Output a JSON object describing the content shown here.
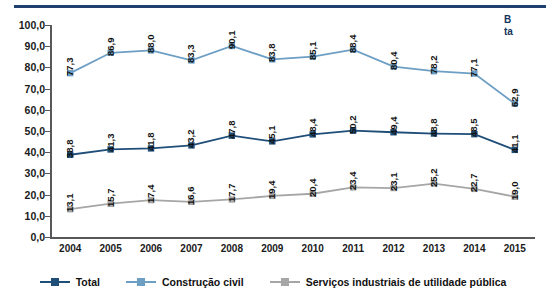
{
  "corner_note": {
    "line1": "B",
    "line2": "ta"
  },
  "legend": {
    "position": "bottom-center",
    "items": [
      {
        "label": "Total",
        "color": "#1f4e79",
        "marker": "square"
      },
      {
        "label": "Construção civil",
        "color": "#6d9ec4",
        "marker": "square"
      },
      {
        "label": "Serviços industriais de utilidade pública",
        "color": "#a6a6a6",
        "marker": "square"
      }
    ]
  },
  "chart_data": {
    "type": "line",
    "title": "",
    "subtitle": "",
    "xlabel": "",
    "ylabel": "",
    "ylim": [
      0,
      100
    ],
    "ytick_step": 10,
    "grid": false,
    "legend_position": "bottom-center",
    "decimal_separator": ",",
    "categories": [
      "2004",
      "2005",
      "2006",
      "2007",
      "2008",
      "2009",
      "2010",
      "2011",
      "2012",
      "2013",
      "2014",
      "2015"
    ],
    "ytick_labels": [
      "0,0",
      "10,0",
      "20,0",
      "30,0",
      "40,0",
      "50,0",
      "60,0",
      "70,0",
      "80,0",
      "90,0",
      "100,0"
    ],
    "ytick_values": [
      0,
      10,
      20,
      30,
      40,
      50,
      60,
      70,
      80,
      90,
      100
    ],
    "series": [
      {
        "name": "Construção civil",
        "color": "#6d9ec4",
        "values": [
          77.3,
          86.9,
          88.0,
          83.3,
          90.1,
          83.8,
          85.1,
          88.4,
          80.4,
          78.2,
          77.1,
          62.9
        ],
        "labels": [
          "77,3",
          "86,9",
          "88,0",
          "83,3",
          "90,1",
          "83,8",
          "85,1",
          "88,4",
          "80,4",
          "78,2",
          "77,1",
          "62,9"
        ]
      },
      {
        "name": "Total",
        "color": "#1f4e79",
        "values": [
          38.8,
          41.3,
          41.8,
          43.2,
          47.8,
          45.1,
          48.4,
          50.2,
          49.4,
          48.8,
          48.5,
          41.1
        ],
        "labels": [
          "38,8",
          "41,3",
          "41,8",
          "43,2",
          "47,8",
          "45,1",
          "48,4",
          "50,2",
          "49,4",
          "48,8",
          "48,5",
          "41,1"
        ]
      },
      {
        "name": "Serviços industriais de utilidade pública",
        "color": "#a6a6a6",
        "values": [
          13.1,
          15.7,
          17.4,
          16.6,
          17.7,
          19.4,
          20.4,
          23.4,
          23.1,
          25.2,
          22.7,
          19.0
        ],
        "labels": [
          "13,1",
          "15,7",
          "17,4",
          "16,6",
          "17,7",
          "19,4",
          "20,4",
          "23,4",
          "23,1",
          "25,2",
          "22,7",
          "19,0"
        ]
      }
    ]
  }
}
